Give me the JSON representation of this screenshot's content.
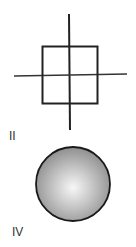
{
  "figure_top": {
    "description": "square with crossing axes",
    "stroke": "#222222"
  },
  "labels": {
    "top_partial": "I",
    "left_middle": "II",
    "bottom_left": "IV"
  },
  "figure_bottom": {
    "description": "shaded sphere",
    "fill_light": "#f4f4f4",
    "fill_dark": "#8a8a8a",
    "stroke": "#1a1a1a"
  }
}
